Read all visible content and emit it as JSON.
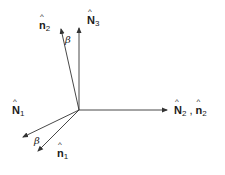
{
  "diagram": {
    "type": "vector-rotation",
    "origin": [
      79,
      110
    ],
    "vectors": [
      {
        "id": "N3",
        "label": "N",
        "sub": "3",
        "tip": [
          79,
          27
        ]
      },
      {
        "id": "n2_upper",
        "label": "n",
        "sub": "2",
        "tip": [
          61,
          28
        ]
      },
      {
        "id": "N2",
        "label": "N",
        "sub": "2",
        "tip": [
          168,
          110
        ]
      },
      {
        "id": "N1",
        "label": "N",
        "sub": "1",
        "tip": [
          22,
          137
        ]
      },
      {
        "id": "n1",
        "label": "n",
        "sub": "1",
        "tip": [
          37,
          152
        ]
      }
    ],
    "labels": {
      "n2_upper": {
        "base": "n",
        "sub": "2"
      },
      "N3": {
        "base": "N",
        "sub": "3"
      },
      "N2_n2": {
        "base1": "N",
        "sub1": "2",
        "sep": ",",
        "base2": "n",
        "sub2": "2"
      },
      "N1": {
        "base": "N",
        "sub": "1"
      },
      "n1": {
        "base": "n",
        "sub": "1"
      }
    },
    "angles": {
      "upper": "β",
      "lower": "β"
    },
    "stroke_color": "#333333"
  }
}
